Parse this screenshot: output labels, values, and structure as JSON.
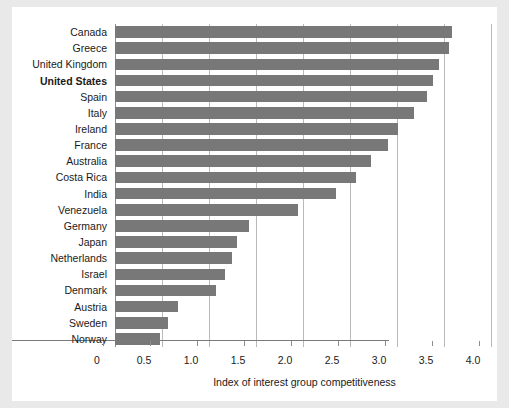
{
  "chart_data": {
    "type": "bar",
    "orientation": "horizontal",
    "title": "",
    "subtitle": "",
    "xlabel": "Index of interest group competitiveness",
    "ylabel": "",
    "xlim": [
      0,
      4.0
    ],
    "xticks": [
      "0",
      "0.5",
      "1.0",
      "1.5",
      "2.0",
      "2.5",
      "3.0",
      "3.5",
      "4.0"
    ],
    "xtick_values": [
      0,
      0.5,
      1.0,
      1.5,
      2.0,
      2.5,
      3.0,
      3.5,
      4.0
    ],
    "grid": "vertical",
    "legend": "none",
    "bar_color": "#787878",
    "highlight_label": "United States",
    "categories": [
      "Canada",
      "Greece",
      "United Kingdom",
      "United States",
      "Spain",
      "Italy",
      "Ireland",
      "France",
      "Australia",
      "Costa Rica",
      "India",
      "Venezuela",
      "Germany",
      "Japan",
      "Netherlands",
      "Israel",
      "Denmark",
      "Austria",
      "Sweden",
      "Norway"
    ],
    "values": [
      3.58,
      3.55,
      3.45,
      3.38,
      3.32,
      3.18,
      3.01,
      2.9,
      2.72,
      2.56,
      2.35,
      1.95,
      1.43,
      1.3,
      1.24,
      1.17,
      1.07,
      0.67,
      0.56,
      0.48
    ]
  },
  "colors": {
    "bar": "#787878",
    "gridline": "#b9b9b9",
    "axis": "#7a7a7a",
    "text": "#1a1a1a",
    "plot_background": "#ffffff",
    "figure_background": "#e9e9e9"
  }
}
